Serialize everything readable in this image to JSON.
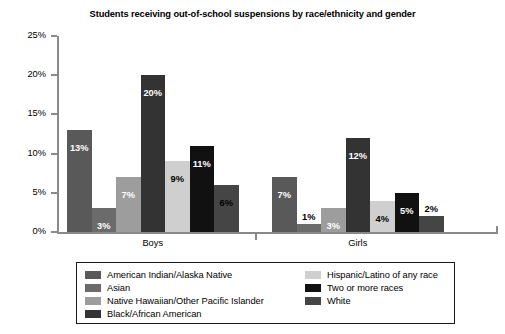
{
  "chart_data": {
    "type": "bar",
    "title": "Students receiving out-of-school suspensions by race/ethnicity and gender",
    "xlabel": "",
    "ylabel": "",
    "ylim": [
      0,
      25
    ],
    "ytick_labels": [
      "0%",
      "5%",
      "10%",
      "15%",
      "20%",
      "25%"
    ],
    "ytick_values": [
      0,
      5,
      10,
      15,
      20,
      25
    ],
    "grid": false,
    "legend_position": "bottom",
    "categories": [
      "Boys",
      "Girls"
    ],
    "series": [
      {
        "name": "American Indian/Alaska Native",
        "color": "#595959",
        "values": [
          13,
          7
        ],
        "labels": [
          "13%",
          "7%"
        ]
      },
      {
        "name": "Asian",
        "color": "#6b6b6b",
        "values": [
          3,
          1
        ],
        "labels": [
          "3%",
          "1%"
        ]
      },
      {
        "name": "Native Hawaiian/Other Pacific Islander",
        "color": "#9d9d9d",
        "values": [
          7,
          3
        ],
        "labels": [
          "7%",
          "3%"
        ]
      },
      {
        "name": "Black/African American",
        "color": "#333333",
        "values": [
          20,
          12
        ],
        "labels": [
          "20%",
          "12%"
        ]
      },
      {
        "name": "Hispanic/Latino of any race",
        "color": "#cfcfcf",
        "values": [
          9,
          4
        ],
        "labels": [
          "9%",
          "4%"
        ]
      },
      {
        "name": "Two or more races",
        "color": "#111111",
        "values": [
          11,
          5
        ],
        "labels": [
          "11%",
          "5%"
        ]
      },
      {
        "name": "White",
        "color": "#454545",
        "values": [
          6,
          2
        ],
        "labels": [
          "6%",
          "2%"
        ]
      }
    ],
    "legend_columns": [
      [
        {
          "name": "American Indian/Alaska Native",
          "color": "#595959"
        },
        {
          "name": "Asian",
          "color": "#6b6b6b"
        },
        {
          "name": "Native Hawaiian/Other Pacific Islander",
          "color": "#9d9d9d"
        },
        {
          "name": "Black/African American",
          "color": "#333333"
        }
      ],
      [
        {
          "name": "Hispanic/Latino of any race",
          "color": "#cfcfcf"
        },
        {
          "name": "Two or more races",
          "color": "#111111"
        },
        {
          "name": "White",
          "color": "#454545"
        }
      ]
    ]
  }
}
